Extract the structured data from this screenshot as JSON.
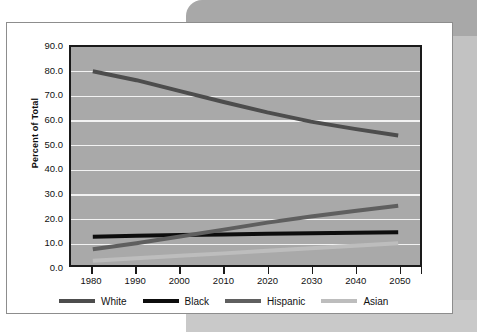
{
  "figure": {
    "y_axis_title": "Percent of Total"
  },
  "colors": {
    "plot_background": "#a9a9a9",
    "gridline": "#f2f2f2",
    "axis": "#1a1a1a",
    "white_series": "#4d4d4d",
    "black_series": "#0d0d0d",
    "hispanic_series": "#5f5f5f",
    "asian_series": "#bdbdbd",
    "card_background": "#ffffff",
    "backdrop_gray": "#a8a8a8"
  },
  "chart_data": {
    "type": "line",
    "title": "",
    "xlabel": "",
    "ylabel": "Percent of Total",
    "x": [
      1980,
      1990,
      2000,
      2010,
      2020,
      2030,
      2040,
      2050
    ],
    "xlim": [
      1975,
      2055
    ],
    "ylim": [
      0.0,
      90.0
    ],
    "ytick_labels": [
      "0.0",
      "10.0",
      "20.0",
      "30.0",
      "40.0",
      "50.0",
      "60.0",
      "70.0",
      "80.0",
      "90.0"
    ],
    "yticks": [
      0.0,
      10.0,
      20.0,
      30.0,
      40.0,
      50.0,
      60.0,
      70.0,
      80.0,
      90.0
    ],
    "xtick_labels": [
      "1980",
      "1990",
      "2000",
      "2010",
      "2020",
      "2030",
      "2040",
      "2050"
    ],
    "grid": "horizontal",
    "legend_position": "bottom",
    "series": [
      {
        "name": "White",
        "color": "#4d4d4d",
        "values": [
          80.0,
          76.3,
          71.8,
          67.3,
          63.0,
          59.2,
          56.2,
          53.5
        ]
      },
      {
        "name": "Black",
        "color": "#0d0d0d",
        "values": [
          11.7,
          12.1,
          12.4,
          12.6,
          12.9,
          13.1,
          13.3,
          13.5
        ]
      },
      {
        "name": "Hispanic",
        "color": "#5f5f5f",
        "values": [
          6.5,
          9.0,
          11.8,
          14.6,
          17.5,
          20.0,
          22.3,
          24.5
        ]
      },
      {
        "name": "Asian",
        "color": "#bdbdbd",
        "values": [
          1.8,
          2.8,
          3.8,
          4.8,
          5.9,
          6.9,
          7.9,
          9.0
        ]
      }
    ]
  }
}
